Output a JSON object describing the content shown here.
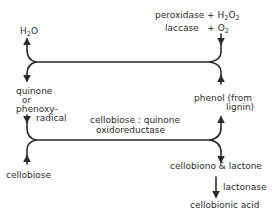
{
  "diagram": {
    "type": "reaction-scheme",
    "nodes": {
      "h2o": {
        "text": "H",
        "sub": "2",
        "text2": "O"
      },
      "peroxidase": {
        "text": "peroxidase + H",
        "sub1": "2",
        "mid": "O",
        "sub2": "2"
      },
      "laccase": {
        "text": "laccase",
        "plus": "+ O",
        "sub": "2"
      },
      "quinone_line1": "quinone",
      "quinone_line2": "or",
      "quinone_line3": "phenoxy-",
      "quinone_line4": "radical",
      "phenol_line1": "phenol (from",
      "phenol_line2": "lignin)",
      "enzyme_line1": "cellobiose : quinone",
      "enzyme_line2": "oxidoreductase",
      "cellobiose": "cellobiose",
      "lactone": "cellobiono & lactone",
      "lactonase": "lactonase",
      "acid": "cellobionic acid"
    },
    "edges": [
      {
        "from": "peroxidase + H2O2 / laccase + O2",
        "to": "H2O",
        "via": "upper branch"
      },
      {
        "from": "phenol (from lignin)",
        "to": "quinone or phenoxy-radical",
        "via": "upper branch"
      },
      {
        "from": "quinone or phenoxy-radical",
        "to": "phenol (from lignin)",
        "via": "cellobiose:quinone oxidoreductase"
      },
      {
        "from": "cellobiose",
        "to": "cellobiono & lactone",
        "via": "cellobiose:quinone oxidoreductase"
      },
      {
        "from": "cellobiono & lactone",
        "to": "cellobionic acid",
        "via": "lactonase"
      }
    ],
    "line_color": "#2a2a2a"
  }
}
